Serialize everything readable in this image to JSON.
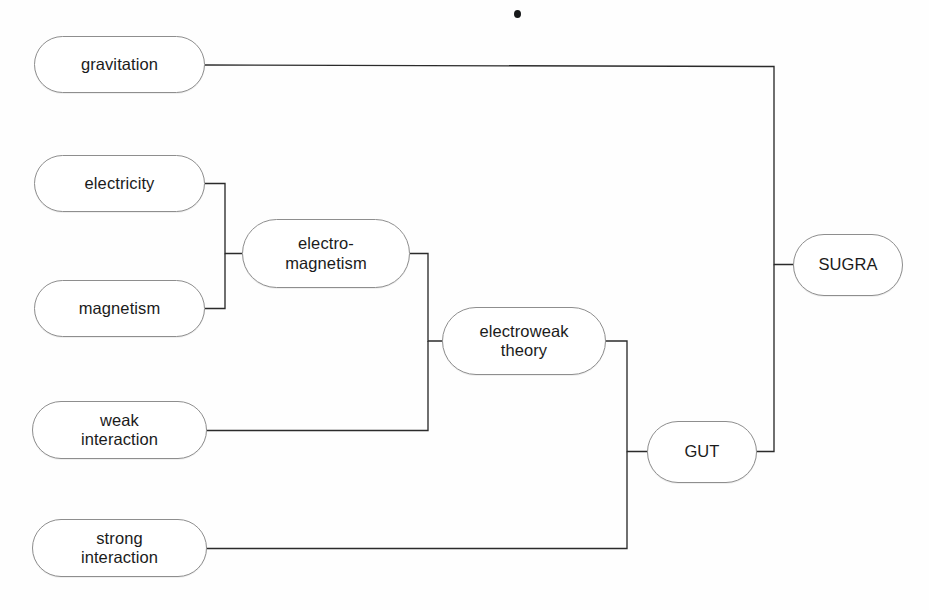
{
  "diagram": {
    "type": "tree",
    "nodes": [
      {
        "id": "gravitation",
        "label": "gravitation",
        "shape": "rounded-rect",
        "x": 34,
        "y": 36,
        "w": 171,
        "h": 57
      },
      {
        "id": "electricity",
        "label": "electricity",
        "shape": "rounded-rect",
        "x": 34,
        "y": 155,
        "w": 171,
        "h": 57
      },
      {
        "id": "magnetism",
        "label": "magnetism",
        "shape": "rounded-rect",
        "x": 34,
        "y": 280,
        "w": 171,
        "h": 57
      },
      {
        "id": "weak-interaction",
        "label": "weak\ninteraction",
        "shape": "rounded-rect",
        "x": 32,
        "y": 401,
        "w": 175,
        "h": 58
      },
      {
        "id": "strong-interaction",
        "label": "strong\ninteraction",
        "shape": "rounded-rect",
        "x": 32,
        "y": 519,
        "w": 175,
        "h": 58
      },
      {
        "id": "electromagnetism",
        "label": "electro-\nmagnetism",
        "shape": "rounded-rect",
        "x": 242,
        "y": 219,
        "w": 168,
        "h": 69
      },
      {
        "id": "electroweak",
        "label": "electroweak\ntheory",
        "shape": "rounded-rect",
        "x": 442,
        "y": 307,
        "w": 164,
        "h": 68
      },
      {
        "id": "gut",
        "label": "GUT",
        "shape": "rounded-rect",
        "x": 647,
        "y": 421,
        "w": 110,
        "h": 62
      },
      {
        "id": "sugra",
        "label": "SUGRA",
        "shape": "rounded-rect",
        "x": 793,
        "y": 234,
        "w": 110,
        "h": 62
      }
    ],
    "edges": [
      {
        "from": "electricity",
        "to": "electromagnetism",
        "junction_x": 225
      },
      {
        "from": "magnetism",
        "to": "electromagnetism",
        "junction_x": 225
      },
      {
        "from": "electromagnetism",
        "to": "electroweak",
        "junction_x": 428
      },
      {
        "from": "weak-interaction",
        "to": "electroweak",
        "junction_x": 428
      },
      {
        "from": "electroweak",
        "to": "gut",
        "junction_x": 627
      },
      {
        "from": "strong-interaction",
        "to": "gut",
        "junction_x": 627
      },
      {
        "from": "gravitation",
        "to": "sugra",
        "junction_x": 774
      },
      {
        "from": "gut",
        "to": "sugra",
        "junction_x": 774
      }
    ],
    "colors": {
      "node_border": "#8e8e8e",
      "node_fill": "#ffffff",
      "connector": "#2b2b2b",
      "text": "#1b1b1b",
      "background": "#fefefe"
    },
    "artifacts": [
      {
        "id": "speck",
        "kind": "scan-speck",
        "x": 514,
        "y": 10
      }
    ]
  }
}
